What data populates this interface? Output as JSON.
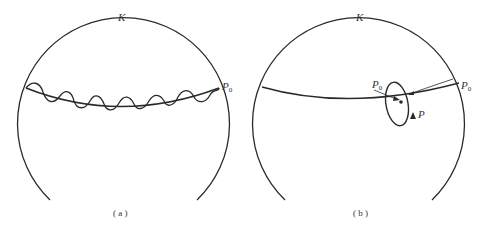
{
  "figure": {
    "panel_a": {
      "caption": "( a )",
      "sphere_label": "K",
      "point_label": "P",
      "point_subscript": "0"
    },
    "panel_b": {
      "caption": "( b )",
      "sphere_label": "K",
      "point_label_edge": "P",
      "point_label_edge_subscript": "0",
      "point_label_inner": "P",
      "point_label_inner_subscript": "0",
      "point_label_loop": "P"
    },
    "colors": {
      "stroke": "#2a2a2a",
      "background": "#ffffff"
    }
  }
}
